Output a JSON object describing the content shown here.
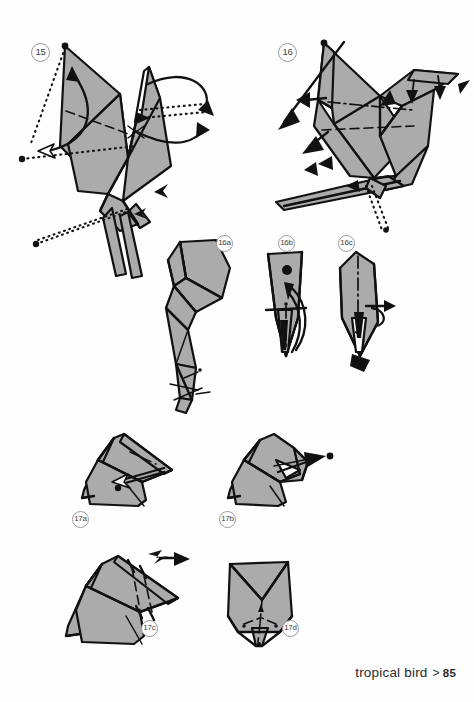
{
  "document": {
    "type": "origami-instructions",
    "background_color": "#ffffff",
    "paper_fill_color": "#ababab",
    "line_color": "#111111"
  },
  "footer": {
    "chapter_label": "tropical bird",
    "separator": ">",
    "page_number": "85"
  },
  "steps": [
    {
      "id": "step-15",
      "badge": "15",
      "description": "Full bird form, front view: swing wing and tail, with rotation arrows and hidden-edge dotted lines"
    },
    {
      "id": "step-16",
      "badge": "16",
      "description": "Bird rotated with beak shaped, wing crimps and leg pleats indicated by small solid arrows"
    },
    {
      "id": "step-16a",
      "badge": "16a",
      "description": "Close-up of the leg and claw region, showing layered narrow folds"
    },
    {
      "id": "step-16b",
      "badge": "16b",
      "description": "Close-up of the tail tip with curved swing arrow and mountain fold centre line"
    },
    {
      "id": "step-16c",
      "badge": "16c",
      "description": "Close-up of the tail after folding, centre mountain fold and tuck arrow"
    },
    {
      "id": "step-17a",
      "badge": "17a",
      "description": "Head close-up: reverse fold the beak, open arrow points into the pocket"
    },
    {
      "id": "step-17b",
      "badge": "17b",
      "description": "Head close-up: beak pulled out to the right with a solid push arrow"
    },
    {
      "id": "step-17c",
      "badge": "17c",
      "description": "Head close-up: crimp the beak, zig-zag repeat arrow above the head"
    },
    {
      "id": "step-17d",
      "badge": "17d",
      "description": "Front view of the finished head with valley fold creases on the beak"
    }
  ]
}
